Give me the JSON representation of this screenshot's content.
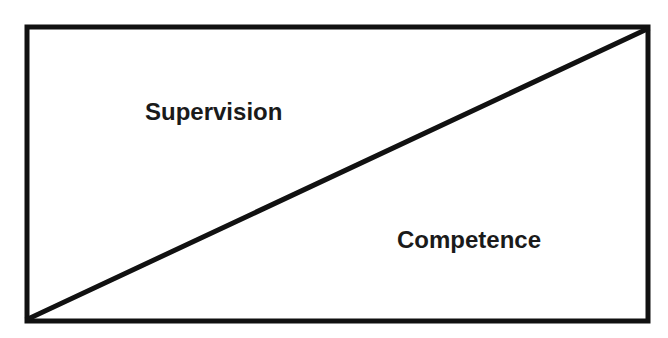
{
  "diagram": {
    "type": "box-split-diagonal",
    "regions": [
      {
        "label": "Supervision",
        "position": "upper-left triangle"
      },
      {
        "label": "Competence",
        "position": "lower-right triangle"
      }
    ],
    "colors": {
      "line": "#111111",
      "text": "#1a1a1a",
      "background": "#ffffff"
    }
  }
}
